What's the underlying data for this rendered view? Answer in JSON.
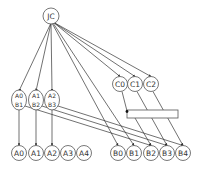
{
  "diagram": {
    "root": {
      "id": "JC",
      "label": "JC",
      "x": 51,
      "y": 16,
      "r": 8
    },
    "c_nodes": [
      {
        "id": "C0",
        "label": "C0",
        "x": 120,
        "y": 84,
        "r": 7.5
      },
      {
        "id": "C1",
        "label": "C1",
        "x": 135,
        "y": 84,
        "r": 7.5
      },
      {
        "id": "C2",
        "label": "C2",
        "x": 151,
        "y": 84,
        "r": 7.5
      }
    ],
    "pair_nodes": [
      {
        "id": "A0B1",
        "top": "A0",
        "bottom": "B1",
        "x": 19,
        "y": 100
      },
      {
        "id": "A1B2",
        "top": "A1",
        "bottom": "B2",
        "x": 36,
        "y": 100
      },
      {
        "id": "A2B3",
        "top": "A2",
        "bottom": "B3",
        "x": 52,
        "y": 100
      }
    ],
    "a_nodes": [
      {
        "id": "A0",
        "label": "A0",
        "x": 19,
        "y": 153
      },
      {
        "id": "A1",
        "label": "A1",
        "x": 36,
        "y": 153
      },
      {
        "id": "A2",
        "label": "A2",
        "x": 52,
        "y": 153
      },
      {
        "id": "A3",
        "label": "A3",
        "x": 68,
        "y": 153
      },
      {
        "id": "A4",
        "label": "A4",
        "x": 84,
        "y": 153
      }
    ],
    "b_nodes": [
      {
        "id": "B0",
        "label": "B0",
        "x": 118,
        "y": 153
      },
      {
        "id": "B1",
        "label": "B1",
        "x": 134,
        "y": 153
      },
      {
        "id": "B2",
        "label": "B2",
        "x": 151,
        "y": 153
      },
      {
        "id": "B3",
        "label": "B3",
        "x": 167,
        "y": 153
      },
      {
        "id": "B4",
        "label": "B4",
        "x": 183,
        "y": 153
      }
    ],
    "box": {
      "x": 127,
      "y": 110,
      "w": 51,
      "h": 8
    },
    "colors": {
      "stroke": "#555555",
      "edge": "#333333",
      "text": "#333333",
      "background": "#ffffff"
    }
  }
}
